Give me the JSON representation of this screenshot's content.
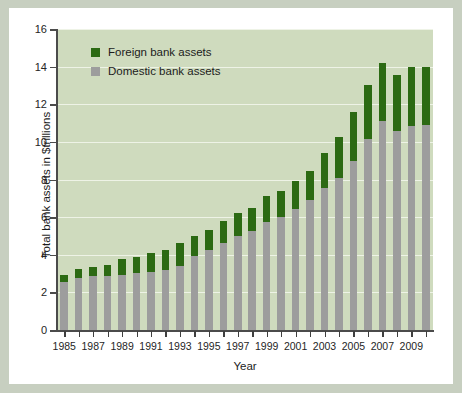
{
  "chart_data": {
    "type": "bar",
    "subtype": "stacked-bar",
    "title": "",
    "xlabel": "Year",
    "ylabel": "Total bank assets in $trillions",
    "ylim": [
      0,
      16
    ],
    "yticks": [
      0,
      2,
      4,
      6,
      8,
      10,
      12,
      14,
      16
    ],
    "grid": true,
    "legend_position": "upper-left",
    "x": [
      1985,
      1986,
      1987,
      1988,
      1989,
      1990,
      1991,
      1992,
      1993,
      1994,
      1995,
      1996,
      1997,
      1998,
      1999,
      2000,
      2001,
      2002,
      2003,
      2004,
      2005,
      2006,
      2007,
      2008,
      2009,
      2010
    ],
    "xtick_labels": [
      "1985",
      "1987",
      "1989",
      "1991",
      "1993",
      "1995",
      "1997",
      "1999",
      "2001",
      "2003",
      "2005",
      "2007",
      "2009"
    ],
    "xtick_values": [
      1985,
      1987,
      1989,
      1991,
      1993,
      1995,
      1997,
      1999,
      2001,
      2003,
      2005,
      2007,
      2009
    ],
    "series": [
      {
        "name": "Domestic bank assets",
        "color": "#9d9d9d",
        "values": [
          2.55,
          2.75,
          2.85,
          2.85,
          2.95,
          3.05,
          3.1,
          3.2,
          3.4,
          3.95,
          4.25,
          4.6,
          5.0,
          5.25,
          5.75,
          6.0,
          6.45,
          6.9,
          7.55,
          8.1,
          9.0,
          10.15,
          11.1,
          10.6,
          10.85,
          10.9
        ]
      },
      {
        "name": "Foreign bank assets",
        "color": "#2c6a13",
        "values": [
          0.4,
          0.5,
          0.5,
          0.6,
          0.8,
          0.85,
          1.0,
          1.05,
          1.2,
          1.05,
          1.05,
          1.2,
          1.2,
          1.25,
          1.35,
          1.4,
          1.45,
          1.55,
          1.85,
          2.15,
          2.6,
          2.85,
          3.1,
          2.95,
          3.15,
          3.1
        ]
      }
    ],
    "totals": [
      2.95,
      3.25,
      3.35,
      3.45,
      3.75,
      3.9,
      4.1,
      4.25,
      4.6,
      5.0,
      5.3,
      5.8,
      6.2,
      6.5,
      7.1,
      7.4,
      7.9,
      8.45,
      9.4,
      10.25,
      11.6,
      13.0,
      14.2,
      13.55,
      14.0,
      14.0
    ]
  },
  "legend": {
    "items": [
      {
        "label": "Foreign bank assets",
        "color": "#2c6a13",
        "swatch_name": "legend-swatch-foreign"
      },
      {
        "label": "Domestic bank assets",
        "color": "#9d9d9d",
        "swatch_name": "legend-swatch-domestic"
      }
    ]
  },
  "colors": {
    "plot_background": "#cfdbbe",
    "figure_background": "#ffffff",
    "outer_background": "#c7cfc0",
    "gridline": "#eef3e6",
    "axis": "#4b4b4b",
    "foreign": "#2c6a13",
    "domestic": "#9d9d9d"
  }
}
